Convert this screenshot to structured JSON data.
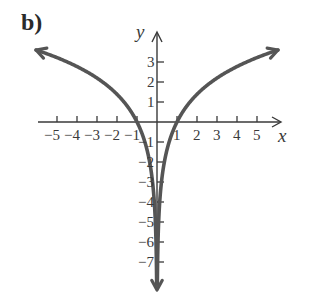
{
  "part_label": "b)",
  "chart_data": {
    "type": "line",
    "title": "",
    "function": "y = 2 ln|x|",
    "xlabel": "x",
    "ylabel": "y",
    "xlim": [
      -6.1,
      6.1
    ],
    "ylim": [
      -8,
      3.6
    ],
    "grid": false,
    "legend": null,
    "x_ticks": [
      -5,
      -4,
      -3,
      -2,
      -1,
      1,
      2,
      3,
      4,
      5
    ],
    "y_ticks": [
      -7,
      -6,
      -5,
      -4,
      -3,
      -2,
      -1,
      1,
      2,
      3
    ],
    "x_tick_labels": [
      "−5",
      "−4",
      "−3",
      "−2",
      "−1",
      "1",
      "2",
      "3",
      "4",
      "5"
    ],
    "y_tick_labels": [
      "−7",
      "−6",
      "−5",
      "−4",
      "−3",
      "−2",
      "−1",
      "1",
      "2",
      "3"
    ],
    "series": [
      {
        "name": "left branch",
        "x": [
          -6.0,
          -5,
          -4,
          -3,
          -2,
          -1,
          -0.5,
          -0.2,
          -0.1,
          -0.05
        ],
        "y": [
          3.58,
          3.22,
          2.77,
          2.2,
          1.39,
          0,
          -1.39,
          -3.22,
          -4.61,
          -5.99
        ]
      },
      {
        "name": "right branch",
        "x": [
          0.05,
          0.1,
          0.2,
          0.5,
          1,
          2,
          3,
          4,
          5,
          6.0
        ],
        "y": [
          -5.99,
          -4.61,
          -3.22,
          -1.39,
          0,
          1.39,
          2.2,
          2.77,
          3.22,
          3.58
        ]
      }
    ],
    "annotations": [
      "vertical asymptote x = 0",
      "x-intercepts at x = −1 and x = 1",
      "arrows indicate branches continue"
    ],
    "colors": {
      "curve": "#555555",
      "axes": "#3a3a3a"
    }
  }
}
